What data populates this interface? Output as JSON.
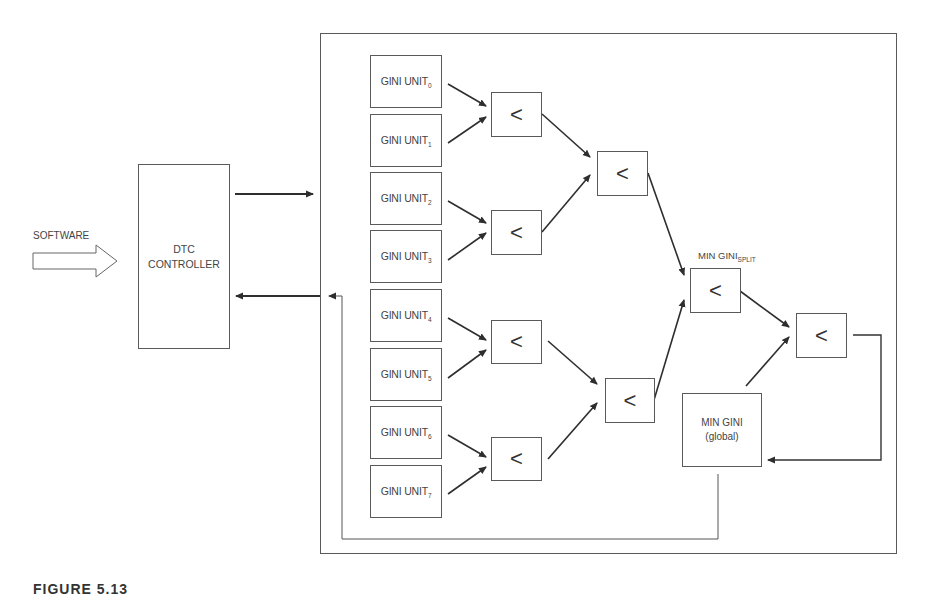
{
  "diagram": {
    "software_label": "SOFTWARE",
    "dtc_controller": {
      "line1": "DTC",
      "line2": "CONTROLLER"
    },
    "gini_units": [
      {
        "label": "GINI UNIT",
        "sub": "0"
      },
      {
        "label": "GINI UNIT",
        "sub": "1"
      },
      {
        "label": "GINI UNIT",
        "sub": "2"
      },
      {
        "label": "GINI UNIT",
        "sub": "3"
      },
      {
        "label": "GINI UNIT",
        "sub": "4"
      },
      {
        "label": "GINI UNIT",
        "sub": "5"
      },
      {
        "label": "GINI UNIT",
        "sub": "6"
      },
      {
        "label": "GINI UNIT",
        "sub": "7"
      }
    ],
    "comparator_symbol": "<",
    "min_gini_split": {
      "label": "MIN GINI",
      "sub": "SPLIT"
    },
    "min_gini_global": {
      "line1": "MIN GINI",
      "line2": "(global)"
    },
    "caption": "FIGURE 5.13"
  },
  "colors": {
    "line": "#2e2e2e",
    "box_border": "#5a5a5a",
    "text": "#444444",
    "background": "#ffffff"
  }
}
